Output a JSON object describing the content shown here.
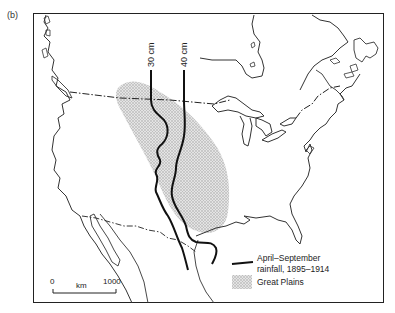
{
  "figure": {
    "panel_label": "(b)"
  },
  "isohyets": [
    {
      "label": "30 cm"
    },
    {
      "label": "40 cm"
    }
  ],
  "legend": {
    "rainfall_line": {
      "line1": "April–September",
      "line2": "rainfall, 1895–1914"
    },
    "great_plains": {
      "label": "Great Plains"
    }
  },
  "scale_bar": {
    "start": "0",
    "unit": "km",
    "end": "1000"
  },
  "colors": {
    "coast": "#333333",
    "isohyet": "#111111",
    "plains_fill": "#c8c8c8",
    "frame": "#222222"
  }
}
